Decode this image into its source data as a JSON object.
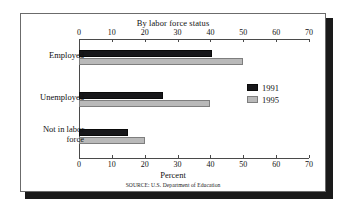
{
  "figure": {
    "title": "By labor force status",
    "source": "SOURCE: U.S. Department of Education"
  },
  "chart_data": {
    "type": "bar",
    "orientation": "horizontal",
    "title": "By labor force status",
    "xlabel": "Percent",
    "ylabel": "",
    "xlim": [
      0,
      70
    ],
    "xticks": [
      0,
      10,
      20,
      30,
      40,
      50,
      60,
      70
    ],
    "xtick_labels": [
      "0",
      "10",
      "20",
      "30",
      "40",
      "50",
      "60",
      "70"
    ],
    "grid": false,
    "legend_position": "right",
    "categories": [
      "Employed",
      "Unemployed",
      "Not in labor\nforce"
    ],
    "series": [
      {
        "name": "1991",
        "color": "#17171a",
        "values": [
          40.5,
          25.5,
          15.0
        ]
      },
      {
        "name": "1995",
        "color": "#b9b9b9",
        "values": [
          50.0,
          40.0,
          20.0
        ]
      }
    ],
    "annotations": [
      "SOURCE: U.S. Department of Education"
    ]
  }
}
